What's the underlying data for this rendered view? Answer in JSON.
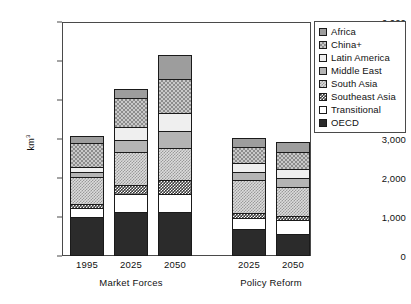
{
  "chart_data": {
    "type": "bar",
    "subtype": "stacked-bar",
    "title": "",
    "xlabel": "",
    "ylabel": "km3",
    "ylabel_display": "km",
    "ylabel_sup": "3",
    "ylim": [
      0,
      6000
    ],
    "ytick_step": 1000,
    "grid": false,
    "legend_position": "right-outside",
    "ytick_labels": [
      "6,000",
      "5,000",
      "4,000",
      "3,000",
      "2,000",
      "1,000",
      "0"
    ],
    "ytick_values": [
      6000,
      5000,
      4000,
      3000,
      2000,
      1000,
      0
    ],
    "groups": [
      {
        "name": "Market Forces",
        "categories": [
          "1995",
          "2025",
          "2050"
        ]
      },
      {
        "name": "Policy Reform",
        "categories": [
          "2025",
          "2050"
        ]
      }
    ],
    "categories": [
      "1995",
      "2025",
      "2050",
      "2025",
      "2050"
    ],
    "series": [
      {
        "name": "OECD",
        "swatch": "oecd",
        "values": [
          1000,
          1120,
          1130,
          700,
          570
        ]
      },
      {
        "name": "Transitional",
        "swatch": "transitional",
        "values": [
          230,
          460,
          460,
          280,
          360
        ]
      },
      {
        "name": "Southeast Asia",
        "swatch": "seasia",
        "values": [
          100,
          230,
          360,
          120,
          90
        ]
      },
      {
        "name": "South Asia",
        "swatch": "southasia",
        "values": [
          700,
          850,
          820,
          850,
          740
        ]
      },
      {
        "name": "Middle East",
        "swatch": "mideast",
        "values": [
          120,
          310,
          430,
          210,
          250
        ]
      },
      {
        "name": "Latin America",
        "swatch": "latin",
        "values": [
          140,
          330,
          460,
          230,
          230
        ]
      },
      {
        "name": "China+",
        "swatch": "china",
        "values": [
          620,
          740,
          870,
          400,
          440
        ]
      },
      {
        "name": "Africa",
        "swatch": "africa",
        "values": [
          170,
          240,
          620,
          230,
          240
        ]
      }
    ],
    "totals": [
      3080,
      4280,
      5150,
      2920,
      2920
    ]
  },
  "legend": {
    "items": [
      {
        "label": "Africa",
        "swatch": "africa"
      },
      {
        "label": "China+",
        "swatch": "china"
      },
      {
        "label": "Latin America",
        "swatch": "latin"
      },
      {
        "label": "Middle East",
        "swatch": "mideast"
      },
      {
        "label": "South Asia",
        "swatch": "southasia"
      },
      {
        "label": "Southeast Asia",
        "swatch": "seasia"
      },
      {
        "label": "Transitional",
        "swatch": "transitional"
      },
      {
        "label": "OECD",
        "swatch": "oecd"
      }
    ]
  },
  "colors": {
    "africa": "#9d9d9d",
    "china": "#c9c9c9",
    "latin": "#efefef",
    "mideast": "#b4b4b4",
    "southasia": "#dcdcdc",
    "seasia": "#3a3a3a",
    "transitional": "#ffffff",
    "oecd": "#2b2b2b",
    "axis": "#4a4a4a",
    "outline": "#1a1a1a"
  }
}
